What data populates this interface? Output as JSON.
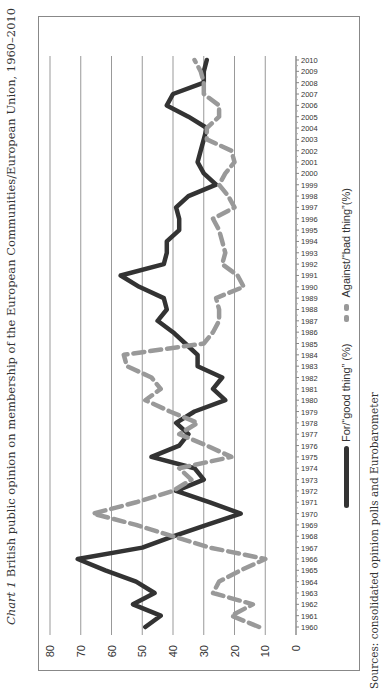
{
  "title": {
    "prefix": "Chart 1",
    "text": "British public opinion on membership of the European Communities/European Union, 1960–2010"
  },
  "sources": "Sources: consolidated opinion polls and Eurobarometer",
  "legend": {
    "for_label": "For/“good thing” (%)",
    "against_label": "Against/“bad thing”(%)"
  },
  "colors": {
    "for": "#333333",
    "against": "#999999",
    "grid": "#999999"
  },
  "chart_data": {
    "type": "line",
    "title": "British public opinion on membership of the European Communities/European Union, 1960–2010",
    "xlabel": "",
    "ylabel": "",
    "ylim": [
      0,
      80
    ],
    "yticks": [
      0,
      10,
      20,
      30,
      40,
      50,
      60,
      70,
      80
    ],
    "grid": true,
    "legend_position": "bottom",
    "categories": [
      "1960",
      "1961",
      "1962",
      "1963",
      "1964",
      "1965",
      "1966",
      "1967",
      "1968",
      "1969",
      "1970",
      "1971",
      "1972",
      "1973",
      "1974",
      "1975",
      "1976",
      "1977",
      "1978",
      "1979",
      "1980",
      "1981",
      "1982",
      "1983",
      "1984",
      "1985",
      "1986",
      "1987",
      "1988",
      "1989",
      "1990",
      "1991",
      "1992",
      "1993",
      "1994",
      "1995",
      "1996",
      "1997",
      "1998",
      "1999",
      "2000",
      "2001",
      "2002",
      "2003",
      "2004",
      "2005",
      "2006",
      "2007",
      "2008",
      "2009",
      "2010"
    ],
    "series": [
      {
        "name": "For/“good thing” (%)",
        "style": "solid",
        "values": [
          49,
          44,
          53,
          46,
          52,
          62,
          71,
          50,
          40,
          29,
          18,
          28,
          39,
          30,
          33,
          47,
          38,
          35,
          39,
          33,
          23,
          27,
          24,
          32,
          32,
          36,
          40,
          45,
          42,
          43,
          51,
          57,
          43,
          42,
          42,
          38,
          38,
          39,
          35,
          26,
          30,
          32,
          31,
          30,
          29,
          35,
          42,
          40,
          30,
          30,
          29
        ]
      },
      {
        "name": "Against/“bad thing”(%)",
        "style": "dashed",
        "values": [
          12,
          21,
          14,
          27,
          25,
          18,
          10,
          28,
          40,
          52,
          66,
          52,
          40,
          34,
          38,
          21,
          29,
          38,
          32,
          41,
          49,
          44,
          47,
          55,
          56,
          30,
          27,
          25,
          25,
          26,
          17,
          19,
          24,
          23,
          24,
          25,
          27,
          20,
          22,
          25,
          23,
          20,
          21,
          29,
          29,
          25,
          25,
          30,
          30,
          31,
          33
        ]
      }
    ]
  }
}
